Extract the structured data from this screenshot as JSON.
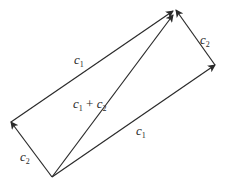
{
  "diagram": {
    "type": "vector-parallelogram",
    "line_color": "#2a2a2a",
    "vertices": {
      "origin": [
        52,
        177
      ],
      "left": [
        11,
        122
      ],
      "right": [
        215,
        65
      ],
      "top": [
        175,
        10
      ]
    },
    "vectors": [
      {
        "id": "c2-left",
        "from": "origin",
        "to": "left",
        "label_base": "c",
        "label_sub": "2"
      },
      {
        "id": "c1-top",
        "from": "left",
        "to": "top",
        "label_base": "c",
        "label_sub": "1"
      },
      {
        "id": "c1-bottom",
        "from": "origin",
        "to": "right",
        "label_base": "c",
        "label_sub": "1"
      },
      {
        "id": "c2-right",
        "from": "right",
        "to": "top",
        "label_base": "c",
        "label_sub": "2"
      },
      {
        "id": "sum",
        "from": "origin",
        "to": "top",
        "label": "c1 + c2"
      }
    ],
    "labels": {
      "c1_top": {
        "base": "c",
        "sub": "1"
      },
      "c1_bottom": {
        "base": "c",
        "sub": "1"
      },
      "c2_left": {
        "base": "c",
        "sub": "2"
      },
      "c2_right": {
        "base": "c",
        "sub": "2"
      },
      "sum": {
        "a_base": "c",
        "a_sub": "1",
        "op": "+",
        "b_base": "c",
        "b_sub": "2"
      }
    }
  }
}
